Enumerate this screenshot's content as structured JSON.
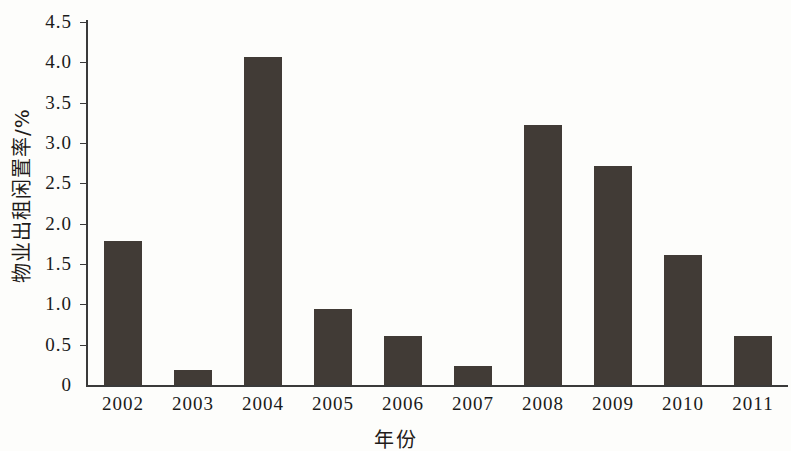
{
  "chart_data": {
    "type": "bar",
    "title": "",
    "xlabel": "年份",
    "ylabel": "物业出租闲置率/%",
    "categories": [
      "2002",
      "2003",
      "2004",
      "2005",
      "2006",
      "2007",
      "2008",
      "2009",
      "2010",
      "2011"
    ],
    "values": [
      1.78,
      0.18,
      4.07,
      0.94,
      0.61,
      0.23,
      3.22,
      2.72,
      1.61,
      0.61
    ],
    "ylim": [
      0,
      4.5
    ],
    "ytick_labels": [
      "0",
      "0.5",
      "1.0",
      "1.5",
      "2.0",
      "2.5",
      "3.0",
      "3.5",
      "4.0",
      "4.5"
    ],
    "ytick_values": [
      0,
      0.5,
      1.0,
      1.5,
      2.0,
      2.5,
      3.0,
      3.5,
      4.0,
      4.5
    ],
    "grid": false,
    "legend": null,
    "bar_color": "#413b36",
    "axis_color": "#3a3a3a",
    "background_color": "#fdfdfb"
  }
}
